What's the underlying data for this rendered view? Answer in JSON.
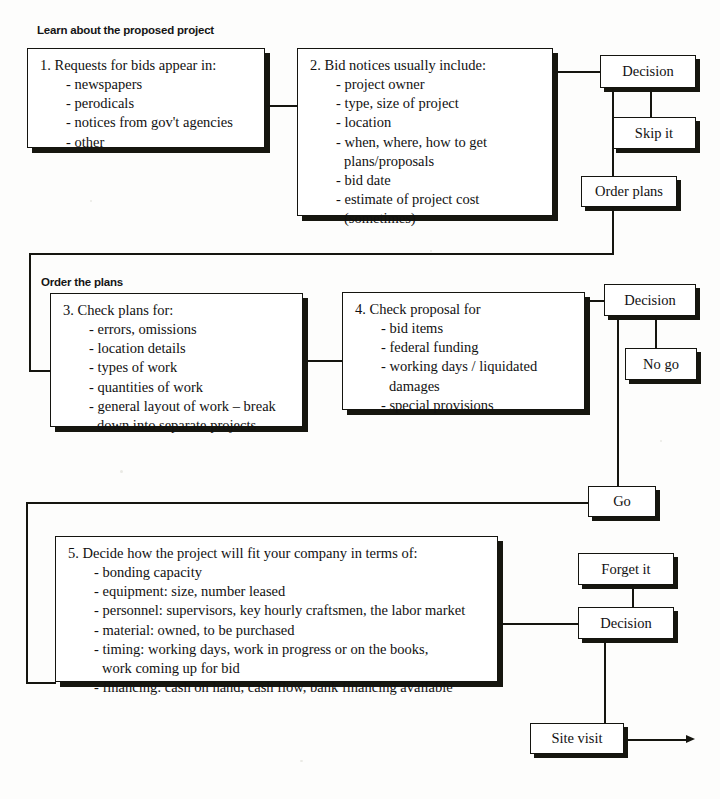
{
  "diagram": {
    "sections": [
      {
        "heading": "Learn about the proposed project"
      },
      {
        "heading": "Order the plans"
      }
    ],
    "steps": [
      {
        "number": "1.",
        "title": "Requests for bids appear in:",
        "items": [
          "- newspapers",
          "- perodicals",
          "- notices from gov't agencies",
          "- other"
        ]
      },
      {
        "number": "2.",
        "title": "Bid notices usually include:",
        "items": [
          "- project owner",
          "- type, size of project",
          "- location",
          "- when, where, how to get",
          "plans/proposals",
          "- bid date",
          "- estimate of project cost",
          "(sometimes)"
        ]
      },
      {
        "number": "3.",
        "title": "Check plans for:",
        "items": [
          "- errors, omissions",
          "- location details",
          "- types of work",
          "- quantities of work",
          "- general layout of work – break",
          "down into separate projects"
        ]
      },
      {
        "number": "4.",
        "title": "Check proposal for",
        "items": [
          "- bid items",
          "- federal funding",
          "- working days / liquidated",
          "damages",
          "- special provisions"
        ]
      },
      {
        "number": "5.",
        "title": "Decide how the project will fit your company in terms of:",
        "items": [
          "- bonding capacity",
          "- equipment: size, number leased",
          "- personnel: supervisors, key hourly craftsmen, the labor market",
          "- material: owned, to be purchased",
          "- timing: working days, work in progress or on the books,",
          "work coming up for bid",
          "- financing: cash on hand, cash flow, bank financing available"
        ]
      }
    ],
    "nodes": {
      "decision_1": "Decision",
      "skip_it": "Skip it",
      "order_plans": "Order plans",
      "decision_2": "Decision",
      "no_go": "No go",
      "go": "Go",
      "forget_it": "Forget it",
      "decision_3": "Decision",
      "site_visit": "Site visit"
    },
    "colors": {
      "ink": "#15150f",
      "paper": "#fdfdfc",
      "box_fill": "#ffffff"
    }
  }
}
